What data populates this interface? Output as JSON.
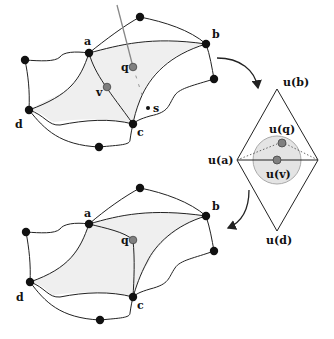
{
  "figure": {
    "top_mesh": {
      "labels": {
        "a": "a",
        "b": "b",
        "c": "c",
        "d": "d",
        "q": "q",
        "v": "v",
        "s": "s"
      }
    },
    "param_domain": {
      "labels": {
        "ub": "u(b)",
        "uq": "u(q)",
        "ua": "u(a)",
        "uv": "u(v)",
        "ud": "u(d)"
      }
    },
    "bottom_mesh": {
      "labels": {
        "a": "a",
        "b": "b",
        "c": "c",
        "d": "d",
        "q": "q"
      }
    },
    "colors": {
      "node": "#111111",
      "highlight_node": "#808080",
      "face_fill": "#efefef",
      "circle_fill": "#e2e2e2",
      "edge": "#222222"
    }
  }
}
